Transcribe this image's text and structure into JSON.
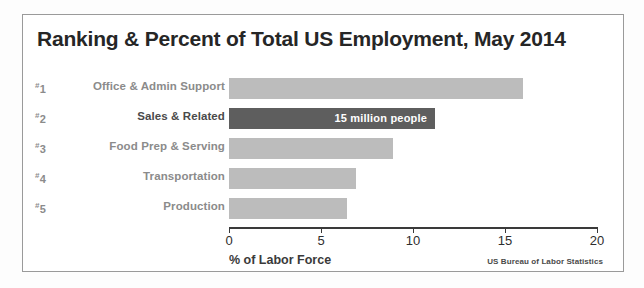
{
  "chart": {
    "title": "Ranking & Percent of Total US Employment, May 2014",
    "xlabel": "% of Labor Force",
    "source": "US Bureau of Labor Statistics"
  },
  "rows": [
    {
      "rank": "1",
      "hash": "#",
      "label": "Office & Admin Support",
      "value": 16.0,
      "value_text": "",
      "highlight": false
    },
    {
      "rank": "2",
      "hash": "#",
      "label": "Sales & Related",
      "value": 11.2,
      "value_text": "15 million people",
      "highlight": true
    },
    {
      "rank": "3",
      "hash": "#",
      "label": "Food Prep & Serving",
      "value": 8.9,
      "value_text": "",
      "highlight": false
    },
    {
      "rank": "4",
      "hash": "#",
      "label": "Transportation",
      "value": 6.9,
      "value_text": "",
      "highlight": false
    },
    {
      "rank": "5",
      "hash": "#",
      "label": "Production",
      "value": 6.4,
      "value_text": "",
      "highlight": false
    }
  ],
  "axis": {
    "ticks": [
      "0",
      "5",
      "10",
      "15",
      "20"
    ],
    "min": 0,
    "max": 20
  },
  "colors": {
    "bar": "#bcbcbc",
    "bar_highlight": "#5e5e5e",
    "label": "#8b8b8b",
    "title": "#262626"
  },
  "chart_data": {
    "type": "bar",
    "orientation": "horizontal",
    "title": "Ranking & Percent of Total US Employment, May 2014",
    "categories": [
      "Office & Admin Support",
      "Sales & Related",
      "Food Prep & Serving",
      "Transportation",
      "Production"
    ],
    "values": [
      16.0,
      11.2,
      8.9,
      6.9,
      6.4
    ],
    "ranks": [
      "#1",
      "#2",
      "#3",
      "#4",
      "#5"
    ],
    "highlighted_index": 1,
    "annotations": [
      "15 million people"
    ],
    "xlabel": "% of Labor Force",
    "ylabel": "",
    "xlim": [
      0,
      20
    ],
    "xticks": [
      0,
      5,
      10,
      15,
      20
    ],
    "grid": false,
    "legend": "none",
    "source": "US Bureau of Labor Statistics"
  }
}
